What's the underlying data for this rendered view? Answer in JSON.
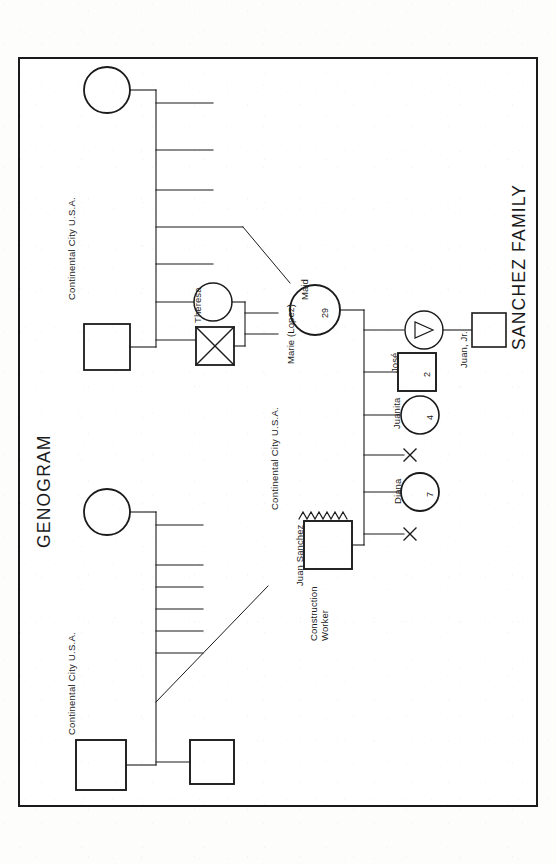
{
  "document": {
    "title_left": "GENOGRAM",
    "title_right": "SANCHEZ FAMILY",
    "orientation": "landscape-rotated",
    "ink_color": "#1a1a1a",
    "paper_color": "#ffffff"
  },
  "locations": {
    "label": "Continental City U.S.A.",
    "occurrences": 3
  },
  "families": {
    "paternal": {
      "location": "Continental City U.S.A.",
      "mother_symbol": "circle",
      "father_symbol": "square",
      "sibling_stub_count": 7,
      "descendant_line_to": "Juan Sanchez",
      "extra_square_label": ""
    },
    "maternal": {
      "location": "Continental City U.S.A.",
      "mother_symbol": "circle",
      "father_symbol": "square",
      "sibling_stub_count": 7,
      "descendant_line_to": "Marie (Lopez)"
    }
  },
  "people": [
    {
      "id": "theresa",
      "name": "Theresa",
      "symbol": "circle",
      "age": "",
      "note": "",
      "deceased": false
    },
    {
      "id": "theresa-spouse",
      "name": "",
      "symbol": "square",
      "age": "",
      "note": "",
      "deceased": true
    },
    {
      "id": "marie",
      "name": "Marie (Lopez)",
      "symbol": "circle",
      "age": "29",
      "note": "Maid",
      "deceased": false
    },
    {
      "id": "juan-sanchez",
      "name": "Juan Sanchez",
      "symbol": "square",
      "age": "",
      "note": "Construction Worker",
      "deceased": false
    }
  ],
  "children": [
    {
      "id": "pregnancy",
      "name": "",
      "symbol": "triangle",
      "age": "",
      "order": 1
    },
    {
      "id": "juan-jr",
      "name": "Juan, Jr.",
      "symbol": "square",
      "age": "",
      "order": 2
    },
    {
      "id": "jose",
      "name": "José",
      "symbol": "square",
      "age": "2",
      "order": 3
    },
    {
      "id": "juanita",
      "name": "Juanita",
      "symbol": "circle",
      "age": "4",
      "order": 4
    },
    {
      "id": "loss-1",
      "name": "",
      "symbol": "x-mark",
      "age": "",
      "order": 5
    },
    {
      "id": "diana",
      "name": "Diana",
      "symbol": "circle",
      "age": "7",
      "order": 6
    },
    {
      "id": "loss-2",
      "name": "",
      "symbol": "x-mark",
      "age": "",
      "order": 7
    }
  ],
  "relationships": {
    "conflict_line": "zigzag",
    "conflict_between": [
      "Juan Sanchez",
      "Marie (Lopez)"
    ]
  },
  "legend_symbols": {
    "circle": "female",
    "square": "male",
    "triangle": "pregnancy",
    "x-mark": "deceased-or-loss",
    "crossed-square": "deceased-male",
    "zigzag": "conflictual-relationship"
  }
}
